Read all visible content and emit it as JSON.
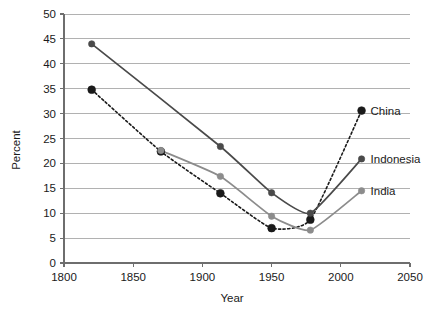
{
  "chart_data": {
    "type": "line",
    "title": "",
    "subtitle": "",
    "xlabel": "Year",
    "ylabel": "Percent",
    "xlim": [
      1800,
      2050
    ],
    "ylim": [
      0,
      50
    ],
    "xticks": [
      1800,
      1850,
      1900,
      1950,
      2000,
      2050
    ],
    "yticks": [
      0,
      5,
      10,
      15,
      20,
      25,
      30,
      35,
      40,
      45,
      50
    ],
    "grid": "horizontal",
    "legend_position": "right-inline-labels",
    "series": [
      {
        "name": "China",
        "color": "#1a1a1a",
        "marker_color": "#1a1a1a",
        "line_style": "dashed",
        "label": "China",
        "points": [
          {
            "x": 1820,
            "y": 34.8
          },
          {
            "x": 1870,
            "y": 22.4
          },
          {
            "x": 1913,
            "y": 14.0
          },
          {
            "x": 1950,
            "y": 7.0
          },
          {
            "x": 1978,
            "y": 8.7
          },
          {
            "x": 2015,
            "y": 30.6
          }
        ]
      },
      {
        "name": "Indonesia",
        "color": "#4a4a4a",
        "marker_color": "#4a4a4a",
        "line_style": "solid",
        "label": "Indonesia",
        "points": [
          {
            "x": 1820,
            "y": 44.0
          },
          {
            "x": 1913,
            "y": 23.4
          },
          {
            "x": 1950,
            "y": 14.1
          },
          {
            "x": 1978,
            "y": 10.0
          },
          {
            "x": 2015,
            "y": 20.9
          }
        ]
      },
      {
        "name": "India",
        "color": "#8c8c8c",
        "marker_color": "#8c8c8c",
        "line_style": "solid",
        "label": "India",
        "points": [
          {
            "x": 1870,
            "y": 22.6
          },
          {
            "x": 1913,
            "y": 17.4
          },
          {
            "x": 1950,
            "y": 9.4
          },
          {
            "x": 1978,
            "y": 6.6
          },
          {
            "x": 2015,
            "y": 14.5
          }
        ]
      }
    ],
    "annotations": []
  }
}
